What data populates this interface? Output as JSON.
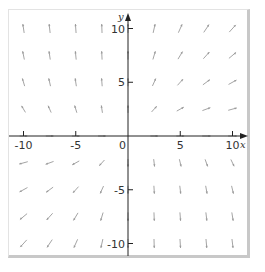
{
  "chart_data": {
    "type": "vector_field",
    "title": "",
    "xlabel": "x",
    "ylabel": "y",
    "xlim": [
      -11,
      11
    ],
    "ylim": [
      -11,
      11
    ],
    "x_ticks": [
      -10,
      -5,
      5,
      10
    ],
    "y_ticks": [
      -10,
      -5,
      5,
      10
    ],
    "x_tick_labels": [
      "-10",
      "-5",
      "0",
      "5",
      "10"
    ],
    "y_tick_labels": [
      "10",
      "5",
      "-5",
      "-10"
    ],
    "origin_label": "0",
    "grid": false,
    "arrow_grid_spacing": 2.5,
    "arrow_color": "#9a9a9a",
    "axis_color": "#222222"
  }
}
